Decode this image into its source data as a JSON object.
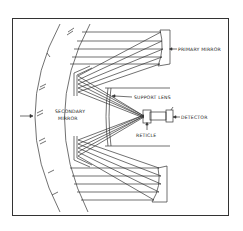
{
  "diagram": {
    "type": "optical-system-schematic",
    "labels": {
      "primary_mirror": "PRIMARY MIRROR",
      "secondary_mirror_line1": "SECONDARY",
      "secondary_mirror_line2": "MIRROR",
      "support_lens": "SUPPORT LENS",
      "detector": "DETECTOR",
      "reticle": "RETICLE"
    },
    "components": [
      "dome",
      "primary-mirror",
      "secondary-mirror",
      "support-lens",
      "reticle",
      "detector"
    ],
    "colors": {
      "line": "#333333",
      "background": "#ffffff"
    }
  }
}
